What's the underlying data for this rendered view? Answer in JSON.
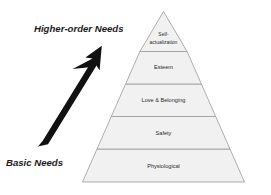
{
  "diagram": {
    "name": "maslow-hierarchy-of-needs-pyramid",
    "background_color": "#ffffff",
    "tier_fill_color": "#f1f1f1",
    "tier_stroke_color": "#9a9a9a",
    "arrow_color": "#111111",
    "label_color": "#1a1a1a",
    "tier_text_color": "#2b2b2b",
    "tiers": [
      {
        "id": "self-actualization",
        "label_line1": "Self-",
        "label_line2": "actualization",
        "level": 5,
        "font_size": 5.0
      },
      {
        "id": "esteem",
        "label_line1": "Esteem",
        "label_line2": "",
        "level": 4,
        "font_size": 5.6
      },
      {
        "id": "love-and-belonging",
        "label_line1": "Love & Belonging",
        "label_line2": "",
        "level": 3,
        "font_size": 5.6
      },
      {
        "id": "safety",
        "label_line1": "Safety",
        "label_line2": "",
        "level": 2,
        "font_size": 5.6
      },
      {
        "id": "physiological",
        "label_line1": "Physiological",
        "label_line2": "",
        "level": 1,
        "font_size": 5.6
      }
    ],
    "annotations": {
      "top_label": "Higher-order Needs",
      "bottom_label": "Basic Needs",
      "arrow_icon_name": "upward-arrow-icon",
      "arrow_direction": "up-right"
    }
  }
}
